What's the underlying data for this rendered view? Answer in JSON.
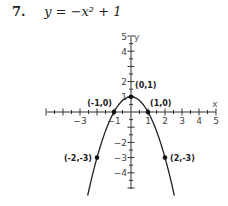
{
  "problem": {
    "number": "7.",
    "equation": "y = −x² + 1"
  },
  "chart_data": {
    "type": "line",
    "xlabel": "x",
    "ylabel": "y",
    "xlim": [
      -5,
      5
    ],
    "ylim": [
      -5,
      5
    ],
    "grid": false,
    "legend": null,
    "x_tick_labels": [
      "-3",
      "-1",
      "1",
      "2",
      "3",
      "4",
      "5"
    ],
    "y_tick_labels": [
      "5",
      "4",
      "2",
      "1",
      "-2",
      "-3",
      "-4"
    ],
    "series": [
      {
        "name": "y = -x^2 + 1",
        "function": "-x^2 + 1",
        "x": [
          -2.55,
          -2,
          -1.5,
          -1,
          -0.5,
          0,
          0.5,
          1,
          1.5,
          2,
          2.55
        ],
        "y": [
          -5.5,
          -3,
          -1.25,
          0,
          0.75,
          1,
          0.75,
          0,
          -1.25,
          -3,
          -5.5
        ]
      }
    ],
    "labeled_points": [
      {
        "x": 0,
        "y": 1,
        "label": "(0,1)"
      },
      {
        "x": -1,
        "y": 0,
        "label": "(-1,0)"
      },
      {
        "x": 1,
        "y": 0,
        "label": "(1,0)"
      },
      {
        "x": -2,
        "y": -3,
        "label": "(-2,-3)"
      },
      {
        "x": 2,
        "y": -3,
        "label": "(2,-3)"
      }
    ]
  }
}
